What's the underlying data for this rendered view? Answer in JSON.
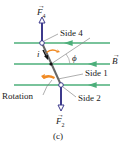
{
  "figure": {
    "label": "(c)",
    "force_top": {
      "symbol": "F",
      "subscript": "4"
    },
    "force_bottom": {
      "symbol": "F",
      "subscript": "2"
    },
    "field": {
      "symbol": "B"
    },
    "current": {
      "symbol": "i"
    },
    "angle": {
      "symbol": "ϕ"
    },
    "labels": {
      "side4": "Side 4",
      "side1": "Side 1",
      "side2": "Side 2",
      "rotation": "Rotation"
    },
    "colors": {
      "field_lines": "#4caf7a",
      "force_arrows": "#3d3a8c",
      "rotation_arrows": "#f08a24",
      "loop": "#555555"
    }
  }
}
